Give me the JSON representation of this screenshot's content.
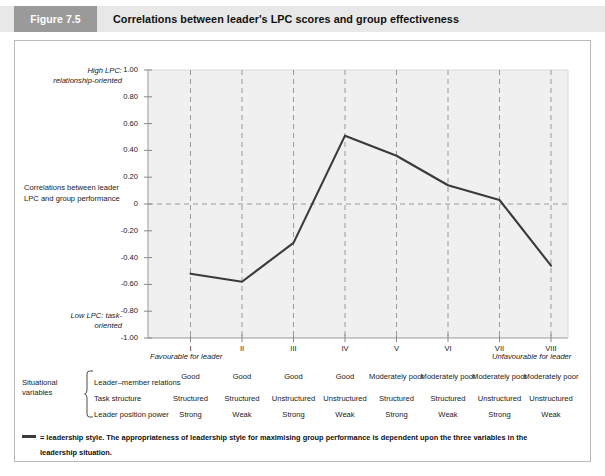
{
  "header": {
    "figure_tag": "Figure 7.5",
    "title": "Correlations between leader's LPC scores and group effectiveness",
    "tag_bg": "#9a9a9a",
    "band_bg": "#e8e8e8"
  },
  "axes": {
    "high_lpc_note": "High LPC: relationship-oriented",
    "low_lpc_note": "Low LPC: task-oriented",
    "y_axis_title": "Correlations between leader LPC and group performance",
    "favourable_note": "Favourable for leader",
    "unfavourable_note": "Unfavourable for leader",
    "y_ticks": [
      "1.00",
      "0.80",
      "0.60",
      "0.40",
      "0.20",
      "0",
      "-0.20",
      "-0.40",
      "-0.60",
      "-0.80",
      "-1.00"
    ],
    "x_ticks": [
      "I",
      "II",
      "III",
      "IV",
      "V",
      "VI",
      "VII",
      "VIII"
    ]
  },
  "chart_data": {
    "type": "line",
    "title": "Correlations between leader's LPC scores and group effectiveness",
    "xlabel": "",
    "ylabel": "Correlations between leader LPC and group performance",
    "categories": [
      "I",
      "II",
      "III",
      "IV",
      "V",
      "VI",
      "VII",
      "VIII"
    ],
    "values": [
      -0.52,
      -0.58,
      -0.29,
      0.51,
      0.36,
      0.14,
      0.03,
      -0.46
    ],
    "series": [
      {
        "name": "leadership style",
        "values": [
          -0.52,
          -0.58,
          -0.29,
          0.51,
          0.36,
          0.14,
          0.03,
          -0.46
        ]
      }
    ],
    "ylim": [
      -1.0,
      1.0
    ],
    "yticks": [
      1.0,
      0.8,
      0.6,
      0.4,
      0.2,
      0,
      -0.2,
      -0.4,
      -0.6,
      -0.8,
      -1.0
    ],
    "grid": "vertical-dashed-plus-zero-line",
    "legend": "none",
    "line_color": "#3a3a3a",
    "plot_bg": "#f0f0f0"
  },
  "situational": {
    "label": "Situational variables",
    "rows": [
      {
        "name": "Leader–member relations",
        "values": [
          "Good",
          "Good",
          "Good",
          "Good",
          "Moderately poor",
          "Moderately poor",
          "Moderately poor",
          "Moderately poor"
        ]
      },
      {
        "name": "Task structure",
        "values": [
          "Structured",
          "Structured",
          "Unstructured",
          "Unstructured",
          "Structured",
          "Structured",
          "Unstructured",
          "Unstructured"
        ]
      },
      {
        "name": "Leader position power",
        "values": [
          "Strong",
          "Weak",
          "Strong",
          "Weak",
          "Strong",
          "Weak",
          "Strong",
          "Weak"
        ]
      }
    ]
  },
  "footnote": {
    "line1": "= leadership style.   The appropriateness of leadership style for maximising group performance is dependent upon the three variables in the",
    "line2": "leadership situation."
  }
}
